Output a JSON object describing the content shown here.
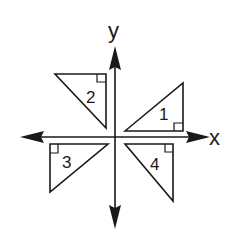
{
  "diagram": {
    "type": "coordinate-plane-transformations",
    "axes": {
      "x_label": "x",
      "y_label": "y",
      "origin": [
        115,
        137
      ]
    },
    "triangles": [
      {
        "label": "1",
        "quadrant": "I",
        "vertices": [
          [
            125,
            131
          ],
          [
            183,
            83
          ],
          [
            183,
            131
          ]
        ],
        "right_angle_at": [
          183,
          131
        ]
      },
      {
        "label": "2",
        "quadrant": "II",
        "vertices": [
          [
            55,
            74
          ],
          [
            106,
            74
          ],
          [
            106,
            128
          ]
        ],
        "right_angle_at": [
          106,
          74
        ]
      },
      {
        "label": "3",
        "quadrant": "III",
        "vertices": [
          [
            50,
            144
          ],
          [
            108,
            144
          ],
          [
            50,
            192
          ]
        ],
        "right_angle_at": [
          50,
          144
        ]
      },
      {
        "label": "4",
        "quadrant": "IV",
        "vertices": [
          [
            125,
            144
          ],
          [
            173,
            144
          ],
          [
            173,
            201
          ]
        ],
        "right_angle_at": [
          173,
          144
        ]
      }
    ],
    "colors": {
      "stroke": "#1a1a1a",
      "background": "#ffffff"
    }
  }
}
